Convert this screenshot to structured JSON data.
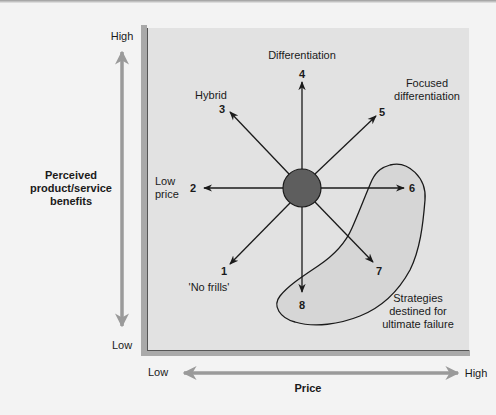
{
  "colors": {
    "background": "#f3f3f3",
    "panel": "#e2e2e2",
    "panel_bevel": "#a9a9a9",
    "axis_arrow": "#9a9a9a",
    "hub": "#5e5e5e",
    "failure_zone": "#d6d6d6",
    "ink": "#1a1a1a"
  },
  "y_axis": {
    "label_line1": "Perceived",
    "label_line2": "product/service",
    "label_line3": "benefits",
    "high": "High",
    "low": "Low"
  },
  "x_axis": {
    "label": "Price",
    "high": "High",
    "low": "Low"
  },
  "strategies": [
    {
      "num": "1",
      "name_line1": "'No frills'",
      "name_line2": ""
    },
    {
      "num": "2",
      "name_line1": "Low",
      "name_line2": "price"
    },
    {
      "num": "3",
      "name_line1": "Hybrid",
      "name_line2": ""
    },
    {
      "num": "4",
      "name_line1": "Differentiation",
      "name_line2": ""
    },
    {
      "num": "5",
      "name_line1": "Focused",
      "name_line2": "differentiation"
    },
    {
      "num": "6",
      "name_line1": "",
      "name_line2": ""
    },
    {
      "num": "7",
      "name_line1": "",
      "name_line2": ""
    },
    {
      "num": "8",
      "name_line1": "",
      "name_line2": ""
    }
  ],
  "failure_zone": {
    "line1": "Strategies",
    "line2": "destined for",
    "line3": "ultimate failure"
  }
}
